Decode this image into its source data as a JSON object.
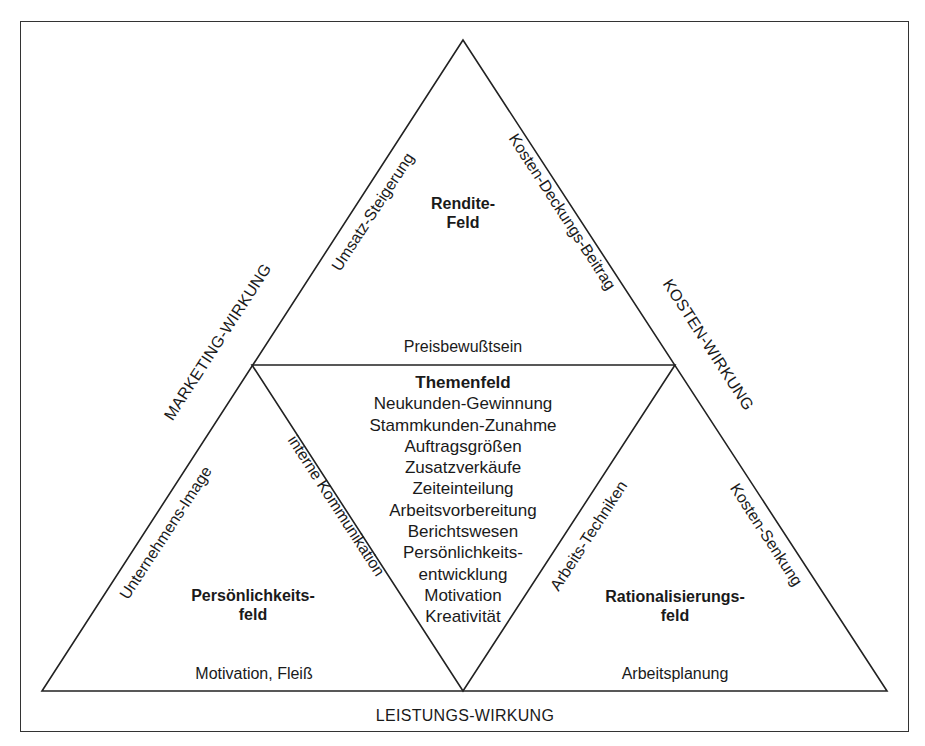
{
  "diagram": {
    "type": "triangle-field-model",
    "outer_axes": {
      "left": "MARKETING-WIRKUNG",
      "right": "KOSTEN-WIRKUNG",
      "bottom": "LEISTUNGS-WIRKUNG"
    },
    "fields": {
      "top": {
        "title_line1": "Rendite-",
        "title_line2": "Feld",
        "left_edge": "Umsatz-Steigerung",
        "right_edge": "Kosten-Deckungs-Beitrag",
        "bottom_edge": "Preisbewußtsein"
      },
      "center": {
        "title": "Themenfeld",
        "items": [
          "Neukunden-Gewinnung",
          "Stammkunden-Zunahme",
          "Auftragsgrößen",
          "Zusatzverkäufe",
          "Zeiteinteilung",
          "Arbeitsvorbereitung",
          "Berichtswesen",
          "Persönlichkeits-",
          "entwicklung",
          "Motivation",
          "Kreativität"
        ]
      },
      "bottom_left": {
        "title_line1": "Persönlichkeits-",
        "title_line2": "feld",
        "left_edge": "Unternehmens-Image",
        "right_edge": "interne Kommunikation",
        "bottom_edge": "Motivation, Fleiß"
      },
      "bottom_right": {
        "title_line1": "Rationalisierungs-",
        "title_line2": "feld",
        "left_edge": "Arbeits-Techniken",
        "right_edge": "Kosten-Senkung",
        "bottom_edge": "Arbeitsplanung"
      }
    },
    "colors": {
      "line": "#222222",
      "text": "#1a1a1a",
      "background": "#ffffff"
    }
  }
}
